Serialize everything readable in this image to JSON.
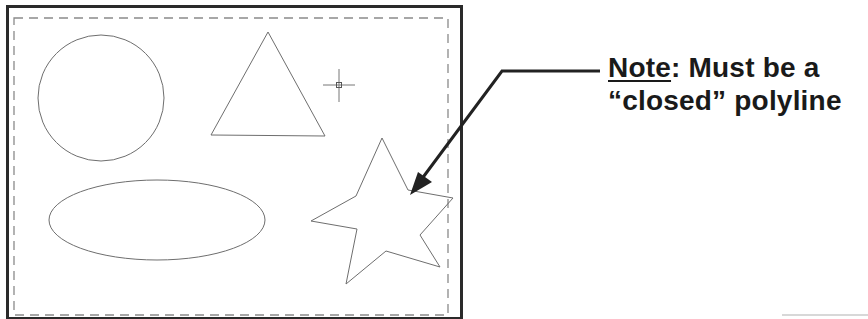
{
  "diagram": {
    "drawing_area": {
      "frame": "solid outer border",
      "boundary": "dashed inner boundary"
    },
    "shapes": [
      {
        "type": "circle",
        "label": "circle"
      },
      {
        "type": "triangle",
        "label": "triangle"
      },
      {
        "type": "ellipse",
        "label": "ellipse"
      },
      {
        "type": "star",
        "label": "star (closed polyline)"
      }
    ],
    "cursor": "crosshair-pickbox",
    "callout": {
      "note_label": "Note",
      "note_rest": ": Must be a",
      "line2": "“closed” polyline"
    },
    "colors": {
      "frame": "#2a2a2a",
      "shape_stroke": "#6e6e6e",
      "dashed": "#8a8a8a",
      "arrow": "#222222",
      "text": "#1a1a1a"
    }
  }
}
